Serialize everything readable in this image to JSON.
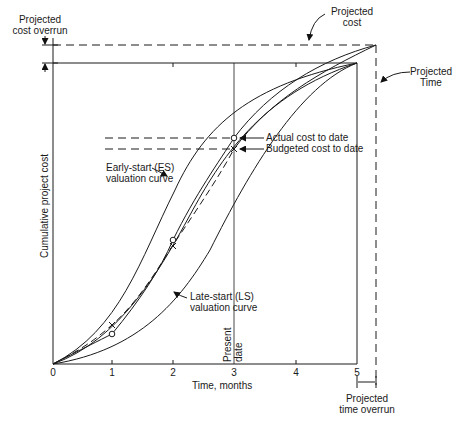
{
  "diagram": {
    "type": "earned-value S-curve diagram",
    "x_axis": {
      "label": "Time, months",
      "ticks": [
        "0",
        "1",
        "2",
        "3",
        "4",
        "5"
      ]
    },
    "y_axis": {
      "label": "Cumulative project cost"
    },
    "annotations": {
      "projected_cost_overrun": "Projected cost overrun",
      "projected_cost": "Projected cost",
      "projected_time": "Projected Time",
      "actual_cost_to_date": "Actual cost to date",
      "budgeted_cost_to_date": "Budgeted cost to date",
      "early_start_curve": "Early-start (ES) valuation curve",
      "late_start_curve": "Late-start (LS) valuation curve",
      "present_date": "Present date",
      "projected_time_overrun": "Projected time overrun"
    },
    "labels": {
      "pc_overrun_line1": "Projected",
      "pc_overrun_line2": "cost overrun",
      "pcost_line1": "Projected",
      "pcost_line2": "cost",
      "ptime_line1": "Projected",
      "ptime_line2": "Time",
      "es_line1": "Early-start (ES)",
      "es_line2": "valuation curve",
      "ls_line1": "Late-start (LS)",
      "ls_line2": "valuation curve",
      "present_line1": "Present",
      "present_line2": "date",
      "pto_line1": "Projected",
      "pto_line2": "time overrun"
    },
    "series": [
      {
        "name": "Early-start (ES) valuation curve",
        "style": "solid"
      },
      {
        "name": "Late-start (LS) valuation curve",
        "style": "solid"
      },
      {
        "name": "Budgeted (planned) curve",
        "style": "solid"
      },
      {
        "name": "Budgeted cost to date (x markers)",
        "style": "dashed",
        "marker": "x"
      },
      {
        "name": "Actual cost to date (o markers)",
        "style": "solid",
        "marker": "o"
      }
    ],
    "present_date_month": 3,
    "planned_completion_month": 5,
    "projected_completion_month": 5.3
  }
}
